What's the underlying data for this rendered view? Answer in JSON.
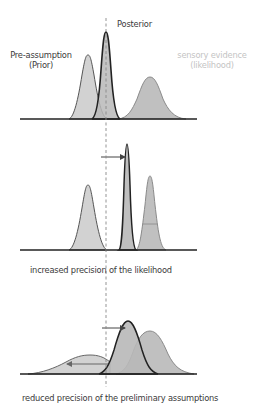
{
  "labels": {
    "posterior": "Posterior",
    "prior_line1": "Pre-assumption",
    "prior_line2": "(Prior)",
    "likelihood_line1": "sensory evidence",
    "likelihood_line2": "(likelihood)",
    "caption_panel2": "increased precision of the likelihood",
    "caption_panel3": "reduced precision of the preliminary assumptions"
  },
  "colors": {
    "prior_fill": "#d2d2d2",
    "posterior_fill": "#b8b8b8",
    "likelihood_fill": "#c0c0c0",
    "outline": "#222222",
    "soft_outline": "#777777",
    "dashed_line": "#888888",
    "light_label": "#c4c4c4"
  },
  "panels": [
    {
      "name": "baseline",
      "distributions": [
        {
          "name": "prior",
          "peak_x": 88,
          "peak_y": 55,
          "base_left": 70,
          "base_right": 106
        },
        {
          "name": "posterior",
          "peak_x": 106,
          "peak_y": 32,
          "base_left": 93,
          "base_right": 120
        },
        {
          "name": "likelihood",
          "peak_x": 150,
          "peak_y": 77,
          "base_left": 120,
          "base_right": 184
        }
      ],
      "baseline_y": 119
    },
    {
      "name": "increased-likelihood-precision",
      "distributions": [
        {
          "name": "prior",
          "peak_x": 88,
          "peak_y": 185,
          "base_left": 70,
          "base_right": 106
        },
        {
          "name": "posterior",
          "peak_x": 127,
          "peak_y": 144,
          "base_left": 120,
          "base_right": 136
        },
        {
          "name": "likelihood",
          "peak_x": 150,
          "peak_y": 176,
          "base_left": 137,
          "base_right": 166
        }
      ],
      "baseline_y": 250,
      "shift_arrow": {
        "from_x": 101,
        "to_x": 125,
        "y": 157,
        "direction": "right"
      }
    },
    {
      "name": "reduced-prior-precision",
      "distributions": [
        {
          "name": "prior",
          "peak_x": 90,
          "peak_y": 355,
          "base_left": 30,
          "base_right": 110
        },
        {
          "name": "posterior",
          "peak_x": 128,
          "peak_y": 321,
          "base_left": 100,
          "base_right": 158
        },
        {
          "name": "likelihood",
          "peak_x": 150,
          "peak_y": 331,
          "base_left": 118,
          "base_right": 192
        }
      ],
      "baseline_y": 374,
      "shift_arrow": {
        "from_x": 102,
        "to_x": 125,
        "y": 328,
        "direction": "right"
      },
      "width_arrow": {
        "from_x": 108,
        "to_x": 67,
        "y": 364,
        "direction": "left"
      }
    }
  ]
}
